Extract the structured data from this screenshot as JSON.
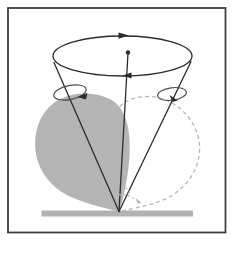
{
  "figure": {
    "type": "physics-diagram",
    "canvas": {
      "width": 240,
      "height": 255,
      "background": "#ffffff"
    },
    "colors": {
      "background": "#ffffff",
      "frame": "#3f3f3f",
      "line_dark": "#2b2b2b",
      "body_gray": "#b4b4b4",
      "bar_gray": "#b2b2b2",
      "dash_gray": "#b6b6b6",
      "spin_gray": "#4f4f4f",
      "pivot_gray": "#b9b9b9"
    },
    "elements": [
      {
        "name": "figure-frame",
        "role": "thin rectangular border around the diagram"
      },
      {
        "name": "ground-bar",
        "role": "gray horizontal surface the top spins on"
      },
      {
        "name": "top-body-solid",
        "role": "gray filled teardrop body of the top, tilted left"
      },
      {
        "name": "top-body-dashed",
        "role": "dashed outline of the top body, tilted right (later position)"
      },
      {
        "name": "precession-circle",
        "role": "ellipse traced by the tip of the top axis"
      },
      {
        "name": "precession-arrow-far",
        "role": "solid arrowhead on far edge of circle, pointing right"
      },
      {
        "name": "precession-arrow-near",
        "role": "solid arrowhead on near edge of circle, pointing left"
      },
      {
        "name": "vertical-axis",
        "role": "central vertical line from pivot to circle center"
      },
      {
        "name": "axis-center-dot",
        "role": "dot marking center of precession circle"
      },
      {
        "name": "cone-edge-left",
        "role": "tilted spin axis of gray top, from pivot to circle rim"
      },
      {
        "name": "cone-edge-right",
        "role": "tilted spin axis of dashed top, from pivot to circle rim"
      },
      {
        "name": "spin-loop-left",
        "role": "small loop with arrow showing spin about left axis"
      },
      {
        "name": "spin-loop-right",
        "role": "small loop with arrow showing spin about right axis"
      },
      {
        "name": "pivot-rotation-mark",
        "role": "small dashed loop and arrow at the pivot point"
      }
    ]
  }
}
